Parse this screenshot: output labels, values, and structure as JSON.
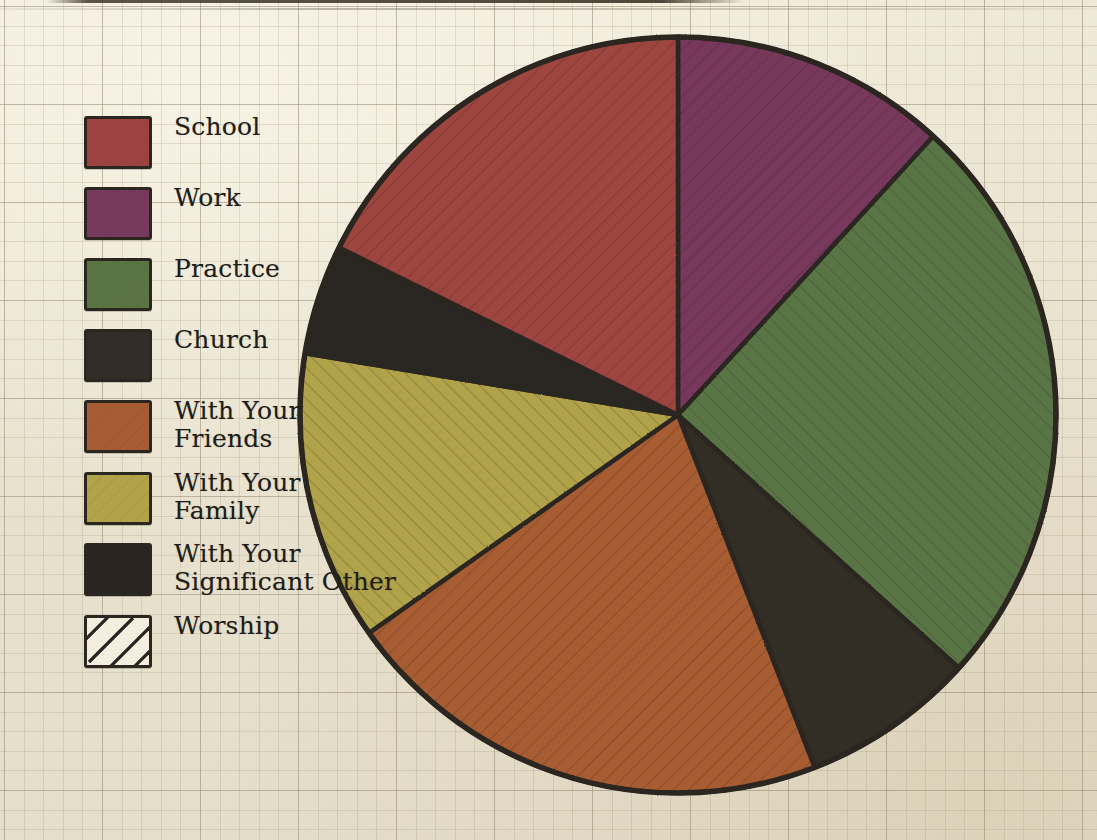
{
  "chart_data": {
    "type": "pie",
    "title": "",
    "legend_position": "left",
    "categories": [
      "School",
      "Work",
      "Practice",
      "Church",
      "With Your Friends",
      "With Your Family",
      "With Your Significant Other",
      "Worship"
    ],
    "values": [
      17.7,
      11.8,
      24.9,
      7.4,
      21.1,
      12.4,
      4.7,
      0
    ],
    "start_angle_deg": 0,
    "direction": "clockwise",
    "slices": [
      {
        "label": "Work",
        "color": "#77395c",
        "start_deg": 0.0,
        "end_deg": 42.5,
        "percent": 11.8
      },
      {
        "label": "Practice",
        "color": "#5a7444",
        "start_deg": 42.5,
        "end_deg": 132.0,
        "percent": 24.9
      },
      {
        "label": "Church",
        "color": "#332d27",
        "start_deg": 132.0,
        "end_deg": 158.8,
        "percent": 7.4
      },
      {
        "label": "With Your Friends",
        "color": "#a85c33",
        "start_deg": 158.8,
        "end_deg": 234.8,
        "percent": 21.1
      },
      {
        "label": "With Your Family",
        "color": "#b0a348",
        "start_deg": 234.8,
        "end_deg": 279.4,
        "percent": 12.4
      },
      {
        "label": "With Your Significant Other",
        "color": "#2b2521",
        "start_deg": 279.4,
        "end_deg": 296.3,
        "percent": 4.7
      },
      {
        "label": "School",
        "color": "#9e4440",
        "start_deg": 296.3,
        "end_deg": 360.0,
        "percent": 17.7
      }
    ],
    "center": {
      "x": 678,
      "y": 415
    },
    "radius": 378,
    "outline_color": "#2b2620"
  },
  "legend": {
    "items": [
      {
        "label": "School",
        "color": "#9e4440",
        "pattern": "solid",
        "name": "school"
      },
      {
        "label": "Work",
        "color": "#77395c",
        "pattern": "solid",
        "name": "work"
      },
      {
        "label": "Practice",
        "color": "#5a7444",
        "pattern": "solid",
        "name": "practice"
      },
      {
        "label": "Church",
        "color": "#332d27",
        "pattern": "solid",
        "name": "church"
      },
      {
        "label": "With Your\nFriends",
        "color": "#a85c33",
        "pattern": "solid",
        "name": "with-your-friends"
      },
      {
        "label": "With Your\nFamily",
        "color": "#b0a348",
        "pattern": "solid",
        "name": "with-your-family"
      },
      {
        "label": "With Your\nSignificant Other",
        "color": "#2b2521",
        "pattern": "solid",
        "name": "with-your-significant-other"
      },
      {
        "label": "Worship",
        "color": "#f2ecda",
        "pattern": "hatch",
        "name": "worship"
      }
    ]
  },
  "colors": {
    "paper": "#ebe5d4",
    "ink": "#2b2620",
    "grid": "#968c73"
  }
}
